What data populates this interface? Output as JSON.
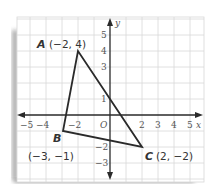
{
  "diagram": {
    "type": "coordinate-plane-triangle",
    "axes": {
      "x_label": "x",
      "y_label": "y",
      "origin_label": "O",
      "x_ticks": [
        {
          "value": -5,
          "label": "−5"
        },
        {
          "value": -4,
          "label": "−4"
        },
        {
          "value": -2,
          "label": "−2"
        },
        {
          "value": 2,
          "label": "2"
        },
        {
          "value": 3,
          "label": "3"
        },
        {
          "value": 4,
          "label": "4"
        },
        {
          "value": 5,
          "label": "5"
        }
      ],
      "y_ticks": [
        {
          "value": 5,
          "label": "5"
        },
        {
          "value": 4,
          "label": "4"
        },
        {
          "value": 3,
          "label": "3"
        },
        {
          "value": 1,
          "label": "1"
        },
        {
          "value": -2,
          "label": "−2"
        },
        {
          "value": -3,
          "label": "−3"
        }
      ],
      "x_range": [
        -6,
        6
      ],
      "y_range": [
        -4,
        6
      ]
    },
    "points": {
      "A": {
        "name": "A",
        "coord_label": "(−2, 4)",
        "x": -2,
        "y": 4
      },
      "B": {
        "name": "B",
        "coord_label": "(−3, −1)",
        "x": -3,
        "y": -1
      },
      "C": {
        "name": "C",
        "coord_label": "(2, −2)",
        "x": 2,
        "y": -2
      }
    },
    "colors": {
      "grid": "#d6d6d6",
      "axis": "#2a2a2a",
      "triangle": "#2a2a2a",
      "shadow": "#9a9a9a"
    }
  }
}
